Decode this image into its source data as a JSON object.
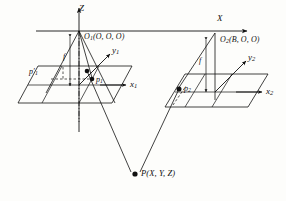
{
  "figure": {
    "type": "geometry-diagram",
    "background_color": "#fdfdfb",
    "stroke_color": "#111111"
  },
  "axes": {
    "world_z": {
      "label": "Z",
      "name": "world-z-axis"
    },
    "world_x": {
      "label": "X",
      "name": "world-x-axis"
    },
    "left_x": {
      "label": "x",
      "sub": "1"
    },
    "left_y": {
      "label": "y",
      "sub": "1"
    },
    "right_x": {
      "label": "x",
      "sub": "2"
    },
    "right_y": {
      "label": "y",
      "sub": "2"
    }
  },
  "origins": {
    "left": {
      "label": "O",
      "sub": "1",
      "coords": "(O, O, O)"
    },
    "right": {
      "label": "O",
      "sub": "2",
      "coords": "(B, O, O)"
    }
  },
  "points": {
    "p1": {
      "label": "p",
      "sub": "1"
    },
    "p1_prime": {
      "label": "p′",
      "sub": "1"
    },
    "p2": {
      "label": "p",
      "sub": "2"
    },
    "world": {
      "label": "P",
      "coords": "(X, Y, Z)"
    }
  },
  "focal": {
    "left": {
      "label": "f"
    },
    "right": {
      "label": "f"
    }
  },
  "planes": {
    "left_image_plane": "left-image-plane",
    "right_image_plane": "right-image-plane"
  }
}
